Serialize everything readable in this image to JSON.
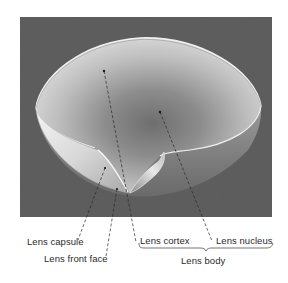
{
  "figure": {
    "background_color": "#5f5f5f",
    "lens_color": "#d4d4d4",
    "nucleus_color": "#7a7a7a",
    "line_color": "#2a2a2a"
  },
  "labels": {
    "lens_capsule": "Lens capsule",
    "lens_front_face": "Lens front face",
    "lens_cortex": "Lens cortex",
    "lens_nucleus": "Lens nucleus",
    "lens_body": "Lens body"
  }
}
